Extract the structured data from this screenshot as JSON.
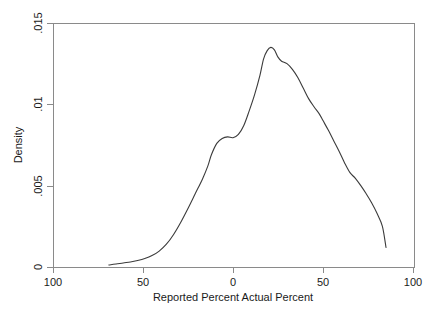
{
  "chart_data": {
    "type": "line",
    "title": "",
    "subtitle": "",
    "xlabel": "Reported Percent  Actual Percent",
    "ylabel": "Density",
    "xlim": [
      -100,
      100
    ],
    "ylim": [
      0,
      0.015
    ],
    "grid": false,
    "legend": null,
    "x_ticks": [
      -100,
      -50,
      0,
      50,
      100
    ],
    "x_tick_labels": [
      "100",
      "50",
      "0",
      "50",
      "100"
    ],
    "y_ticks": [
      0,
      0.005,
      0.01,
      0.015
    ],
    "y_tick_labels": [
      "0",
      ".005",
      ".01",
      ".015"
    ],
    "series": [
      {
        "name": "Kernel density",
        "x": [
          -69,
          -65,
          -61,
          -57,
          -53,
          -49,
          -45,
          -41,
          -37,
          -33,
          -29,
          -25,
          -21,
          -17,
          -14,
          -12,
          -9,
          -6,
          -3,
          0,
          3,
          6,
          9,
          12,
          15,
          17,
          19,
          21,
          23,
          25,
          27,
          30,
          33,
          36,
          39,
          42,
          45,
          48,
          50,
          53,
          56,
          59,
          62,
          65,
          68,
          71,
          74,
          77,
          80,
          83,
          85
        ],
        "y": [
          0.00012,
          0.00018,
          0.00025,
          0.00031,
          0.0004,
          0.00052,
          0.0007,
          0.00098,
          0.0014,
          0.002,
          0.00275,
          0.0036,
          0.0045,
          0.0054,
          0.0062,
          0.0069,
          0.0076,
          0.0079,
          0.008,
          0.00795,
          0.00815,
          0.0087,
          0.0096,
          0.0106,
          0.0118,
          0.0128,
          0.0133,
          0.0135,
          0.01335,
          0.0129,
          0.01265,
          0.0125,
          0.01215,
          0.01165,
          0.011,
          0.01035,
          0.00985,
          0.0094,
          0.009,
          0.0084,
          0.00775,
          0.0071,
          0.0064,
          0.0058,
          0.00545,
          0.005,
          0.0045,
          0.00395,
          0.0033,
          0.0025,
          0.0012
        ]
      }
    ]
  },
  "axis": {
    "y_label": "Density",
    "x_label": "Reported Percent  Actual Percent",
    "x_tick_labels": [
      "100",
      "50",
      "0",
      "50",
      "100"
    ],
    "y_tick_labels": [
      "0",
      ".005",
      ".01",
      ".015"
    ]
  },
  "colors": {
    "curve": "#3b3b3b",
    "frame": "#8a8a8a",
    "text": "#1a1a1a",
    "background": "#ffffff"
  }
}
